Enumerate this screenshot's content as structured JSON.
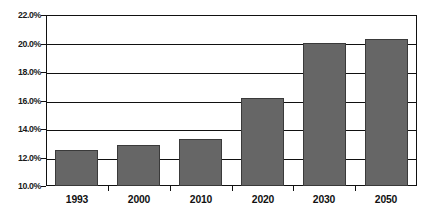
{
  "chart_data": {
    "type": "bar",
    "title": "",
    "xlabel": "",
    "ylabel": "",
    "categories": [
      "1993",
      "2000",
      "2010",
      "2020",
      "2030",
      "2050"
    ],
    "values": [
      12.5,
      12.9,
      13.3,
      16.2,
      20.0,
      20.3
    ],
    "value_suffix": "%",
    "ylim": [
      10.0,
      22.0
    ],
    "ytick_step": 2.0,
    "ytick_labels": [
      "22.0%",
      "20.0%",
      "18.0%",
      "16.0%",
      "14.0%",
      "12.0%",
      "10.0%"
    ],
    "ytick_values": [
      22.0,
      20.0,
      18.0,
      16.0,
      14.0,
      12.0,
      10.0
    ],
    "grid": true,
    "legend": false,
    "series": [
      {
        "name": "",
        "values": [
          12.5,
          12.9,
          13.3,
          16.2,
          20.0,
          20.3
        ]
      }
    ],
    "colors": {
      "bar_fill": "#666666",
      "bar_border": "#3a3a3a",
      "axis": "#111111",
      "background": "#ffffff",
      "text": "#111111"
    }
  },
  "title_remnant": ""
}
